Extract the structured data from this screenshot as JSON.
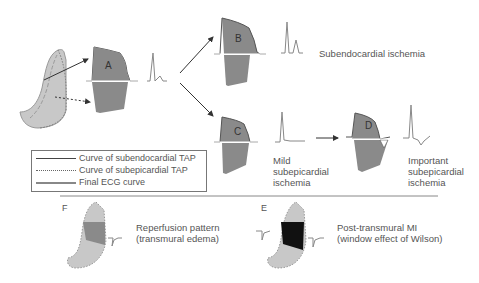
{
  "panels": {
    "A": {
      "label": "A"
    },
    "B": {
      "label": "B",
      "caption": "Subendocardial ischemia"
    },
    "C": {
      "label": "C",
      "caption_lines": [
        "Mild",
        "subepicardial",
        "ischemia"
      ]
    },
    "D": {
      "label": "D",
      "caption_lines": [
        "Important",
        "subepicardial",
        "ischemia"
      ]
    },
    "E": {
      "label": "E",
      "caption_lines": [
        "Post-transmural MI",
        "(window effect of Wilson)"
      ]
    },
    "F": {
      "label": "F",
      "caption_lines": [
        "Reperfusion pattern",
        "(transmural edema)"
      ]
    }
  },
  "legend": {
    "items": [
      {
        "label": "Curve of subendocardial TAP",
        "style": "solid-thin"
      },
      {
        "label": "Curve of subepicardial TAP",
        "style": "dotted"
      },
      {
        "label": "Final ECG curve",
        "style": "solid-thick"
      }
    ]
  },
  "colors": {
    "tap_fill": "#8a8a8a",
    "heart_fill": "#c8c8c8",
    "text": "#555555",
    "line": "#333333"
  }
}
